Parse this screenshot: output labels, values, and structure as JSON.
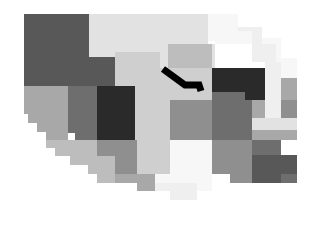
{
  "figure": {
    "kind": "choropleth-map",
    "title": "",
    "subtitle": "",
    "background_color": "#ffffff",
    "width": 324,
    "height": 227
  },
  "palette": {
    "very_dark": "#2a2a2a",
    "dark": "#585858",
    "dark_medium": "#6e6e6e",
    "medium": "#8f8f8f",
    "medium_light": "#a8a8a8",
    "light": "#bdbdbd",
    "lighter": "#cfcfcf",
    "very_light": "#e2e2e2",
    "near_white": "#efefef",
    "off_white": "#f7f7f7",
    "highlight": "#000000",
    "white": "#ffffff"
  },
  "chart_data": {
    "type": "heatmap",
    "title": "",
    "xlabel": "",
    "ylabel": "",
    "grid": false,
    "legend": "none",
    "value_encoding": "grayscale-lightness",
    "regions": [
      {
        "id": "r01",
        "name": "northwest-upper",
        "shade": "dark",
        "fill": "#585858",
        "points": "24,14 89,14 89,57 100,57 100,86 24,86"
      },
      {
        "id": "r02",
        "name": "north-central-west",
        "shade": "very_light",
        "fill": "#e2e2e2",
        "points": "89,14 160,14 160,52 115,52 115,57 89,57"
      },
      {
        "id": "r03",
        "name": "north-central-east",
        "shade": "very_light",
        "fill": "#e2e2e2",
        "points": "160,14 208,14 208,44 215,44 215,68 160,68"
      },
      {
        "id": "r04",
        "name": "northeast-upper",
        "shade": "off_white",
        "fill": "#f7f7f7",
        "points": "208,14 238,14 238,31 252,31 252,44 215,44 215,41 208,41"
      },
      {
        "id": "r05",
        "name": "northeast-corner",
        "shade": "near_white",
        "fill": "#efefef",
        "points": "238,27 262,27 262,44 276,44 276,62 252,62 252,31 238,31"
      },
      {
        "id": "r06",
        "name": "northeast-edge",
        "shade": "off_white",
        "fill": "#f7f7f7",
        "points": "262,38 281,38 281,58 297,58 297,78 276,78 276,44 262,44"
      },
      {
        "id": "r07",
        "name": "central-north-light",
        "shade": "lighter",
        "fill": "#cfcfcf",
        "points": "115,52 160,52 160,68 212,68 212,100 145,100 145,86 115,86"
      },
      {
        "id": "r08",
        "name": "central-band",
        "shade": "light",
        "fill": "#bdbdbd",
        "points": "168,44 212,44 212,68 168,68"
      },
      {
        "id": "r09",
        "name": "west-second-row",
        "shade": "medium_light",
        "fill": "#a8a8a8",
        "points": "24,86 68,86 68,140 46,140 46,132 37,132 37,123 28,123 28,114 24,114"
      },
      {
        "id": "r10",
        "name": "west-central-gray",
        "shade": "dark_medium",
        "fill": "#6e6e6e",
        "points": "68,86 97,86 97,140 75,140 75,133 68,133"
      },
      {
        "id": "r11",
        "name": "central-dark-block",
        "shade": "very_dark",
        "fill": "#2a2a2a",
        "points": "97,86 135,86 135,140 97,140"
      },
      {
        "id": "r12",
        "name": "central-midwest-light",
        "shade": "lighter",
        "fill": "#cfcfcf",
        "points": "135,86 145,86 145,100 170,100 170,140 135,140"
      },
      {
        "id": "r13",
        "name": "central-mid-gray",
        "shade": "medium",
        "fill": "#8f8f8f",
        "points": "170,100 212,100 212,140 170,140"
      },
      {
        "id": "r14",
        "name": "east-dark-block",
        "shade": "very_dark",
        "fill": "#2a2a2a",
        "points": "212,68 265,68 265,100 245,100 245,92 212,92"
      },
      {
        "id": "r15",
        "name": "east-gray-column",
        "shade": "dark_medium",
        "fill": "#6e6e6e",
        "points": "212,92 245,92 245,100 252,100 252,140 212,140"
      },
      {
        "id": "r16",
        "name": "east-light-column",
        "shade": "near_white",
        "fill": "#efefef",
        "points": "265,62 281,62 281,78 297,78 297,125 265,125"
      },
      {
        "id": "r17",
        "name": "far-east-mid",
        "shade": "medium_light",
        "fill": "#a8a8a8",
        "points": "252,100 265,100 265,125 297,125 297,140 252,140"
      },
      {
        "id": "r18",
        "name": "southwest-step",
        "shade": "light",
        "fill": "#bdbdbd",
        "points": "46,140 97,140 97,156 88,156 88,165 70,165 70,156 55,156 55,148 46,148"
      },
      {
        "id": "r19",
        "name": "south-central-gray",
        "shade": "medium",
        "fill": "#8f8f8f",
        "points": "97,140 137,140 137,183 115,183 115,174 97,174"
      },
      {
        "id": "r20",
        "name": "south-central-light",
        "shade": "lighter",
        "fill": "#cfcfcf",
        "points": "137,140 170,140 170,183 155,183 155,191 137,191"
      },
      {
        "id": "r21",
        "name": "south-center-white",
        "shade": "off_white",
        "fill": "#f7f7f7",
        "points": "170,140 212,140 212,191 197,191 197,200 170,200 170,183 155,183 155,174 170,174"
      },
      {
        "id": "r22",
        "name": "southeast-gray",
        "shade": "medium",
        "fill": "#8f8f8f",
        "points": "212,140 252,140 252,183 230,183 230,174 212,174"
      },
      {
        "id": "r23",
        "name": "southeast-dark",
        "shade": "dark_medium",
        "fill": "#6e6e6e",
        "points": "252,140 281,140 281,174 297,174 297,183 252,183"
      },
      {
        "id": "r24",
        "name": "south-lower-light",
        "shade": "near_white",
        "fill": "#efefef",
        "points": "155,183 197,183 197,200 170,200 170,191 155,191"
      },
      {
        "id": "r25",
        "name": "southwest-tail",
        "shade": "light",
        "fill": "#bdbdbd",
        "points": "88,156 115,156 115,183 97,183 97,174 88,174"
      },
      {
        "id": "r26",
        "name": "south-low-step",
        "shade": "medium_light",
        "fill": "#a8a8a8",
        "points": "115,174 155,174 155,191 137,191 137,183 115,183"
      },
      {
        "id": "r27",
        "name": "east-small-light",
        "shade": "very_light",
        "fill": "#e2e2e2",
        "points": "252,118 297,118 297,130 252,130"
      },
      {
        "id": "r28",
        "name": "northeast-strip",
        "shade": "medium_light",
        "fill": "#a8a8a8",
        "points": "281,78 297,78 297,100 281,100"
      },
      {
        "id": "r29",
        "name": "east-notch-gray",
        "shade": "medium",
        "fill": "#8f8f8f",
        "points": "281,100 297,100 297,118 281,118"
      },
      {
        "id": "r30",
        "name": "southeast-corner-dark",
        "shade": "dark",
        "fill": "#585858",
        "points": "252,155 297,155 297,174 281,174 281,183 252,183"
      },
      {
        "id": "r31",
        "name": "west-lower-step",
        "shade": "light",
        "fill": "#bdbdbd",
        "points": "55,148 70,148 70,156 55,156"
      },
      {
        "id": "r32",
        "name": "northwest-notch",
        "shade": "dark",
        "fill": "#585858",
        "points": "89,57 115,57 115,86 89,86"
      }
    ],
    "annotations": [
      {
        "id": "a01",
        "name": "highlighted-route",
        "kind": "polyline",
        "color": "#000000",
        "stroke_width": 7,
        "points": "163,69 185,85 199,85 201,91"
      }
    ]
  }
}
